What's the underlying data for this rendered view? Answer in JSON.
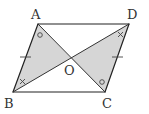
{
  "figure": {
    "type": "parallelogram",
    "points": {
      "A": {
        "label": "A",
        "x": 38,
        "y": 24
      },
      "B": {
        "label": "B",
        "x": 13,
        "y": 92
      },
      "C": {
        "label": "C",
        "x": 105,
        "y": 92
      },
      "D": {
        "label": "D",
        "x": 129,
        "y": 24
      },
      "O": {
        "label": "O",
        "x": 71,
        "y": 58
      }
    },
    "shaded_triangles": [
      "ABO",
      "CDO"
    ],
    "equal_side_ticks": [
      "AB",
      "DC"
    ],
    "angle_marks": [
      {
        "at": "A",
        "symbol": "circle",
        "angle": "BAO"
      },
      {
        "at": "C",
        "symbol": "circle",
        "angle": "DCO"
      },
      {
        "at": "B",
        "symbol": "cross",
        "angle": "ABO"
      },
      {
        "at": "D",
        "symbol": "cross",
        "angle": "CDO"
      }
    ],
    "colors": {
      "line": "#222222",
      "shade": "#d6d6d6",
      "label": "#333333"
    }
  },
  "labels": {
    "A": "A",
    "B": "B",
    "C": "C",
    "D": "D",
    "O": "O"
  }
}
